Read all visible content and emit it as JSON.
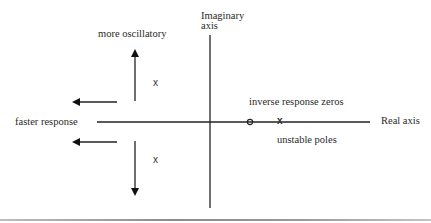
{
  "diagram": {
    "axes": {
      "imaginary_label_line1": "Imaginary",
      "imaginary_label_line2": "axis",
      "real_label": "Real axis"
    },
    "annotations": {
      "more_oscillatory": "more oscillatory",
      "faster_response": "faster response",
      "inverse_response_zeros": "inverse response zeros",
      "unstable_poles": "unstable poles"
    },
    "markers": {
      "upper_pole": "x",
      "lower_pole": "x",
      "rhp_zero": "o",
      "rhp_pole": "x"
    },
    "arrows": [
      {
        "name": "up-arrow",
        "direction": "up",
        "meaning": "more oscillatory"
      },
      {
        "name": "down-arrow",
        "direction": "down",
        "meaning": "more oscillatory"
      },
      {
        "name": "left-arrow-upper",
        "direction": "left",
        "meaning": "faster response"
      },
      {
        "name": "left-arrow-lower",
        "direction": "left",
        "meaning": "faster response"
      }
    ],
    "colors": {
      "background": "#ffffff",
      "lines": "#1a1a1a",
      "text": "#2a2a2a"
    }
  }
}
